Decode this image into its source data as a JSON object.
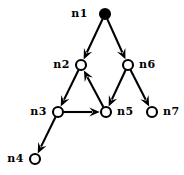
{
  "figure": {
    "type": "directed-graph",
    "background_color": "#ffffff",
    "stroke_color": "#000000",
    "width": 184,
    "height": 175
  },
  "nodes": [
    {
      "id": "n1",
      "label": "n1",
      "x": 105,
      "y": 14,
      "r": 5.0,
      "style": "filled",
      "label_x": 88,
      "label_y": 17,
      "label_anchor": "end"
    },
    {
      "id": "n2",
      "label": "n2",
      "x": 81,
      "y": 65,
      "r": 5.0,
      "style": "open",
      "label_x": 70,
      "label_y": 68,
      "label_anchor": "end"
    },
    {
      "id": "n3",
      "label": "n3",
      "x": 58,
      "y": 112,
      "r": 5.0,
      "style": "open",
      "label_x": 47,
      "label_y": 115,
      "label_anchor": "end"
    },
    {
      "id": "n4",
      "label": "n4",
      "x": 35,
      "y": 159,
      "r": 5.0,
      "style": "open",
      "label_x": 24,
      "label_y": 162,
      "label_anchor": "end"
    },
    {
      "id": "n5",
      "label": "n5",
      "x": 106,
      "y": 112,
      "r": 5.0,
      "style": "open",
      "label_x": 117,
      "label_y": 115,
      "label_anchor": "start"
    },
    {
      "id": "n6",
      "label": "n6",
      "x": 128,
      "y": 65,
      "r": 5.0,
      "style": "open",
      "label_x": 139,
      "label_y": 68,
      "label_anchor": "start"
    },
    {
      "id": "n7",
      "label": "n7",
      "x": 152,
      "y": 112,
      "r": 5.0,
      "style": "open",
      "label_x": 163,
      "label_y": 115,
      "label_anchor": "start"
    }
  ],
  "edges": [
    {
      "id": "e1",
      "from": "n1",
      "to": "n2",
      "directed": true
    },
    {
      "id": "e2",
      "from": "n1",
      "to": "n6",
      "directed": true
    },
    {
      "id": "e3",
      "from": "n2",
      "to": "n3",
      "directed": true
    },
    {
      "id": "e4",
      "from": "n3",
      "to": "n5",
      "directed": true
    },
    {
      "id": "e5",
      "from": "n3",
      "to": "n4",
      "directed": true
    },
    {
      "id": "e6",
      "from": "n5",
      "to": "n2",
      "directed": true
    },
    {
      "id": "e7",
      "from": "n6",
      "to": "n5",
      "directed": true
    },
    {
      "id": "e8",
      "from": "n6",
      "to": "n7",
      "directed": true
    }
  ]
}
